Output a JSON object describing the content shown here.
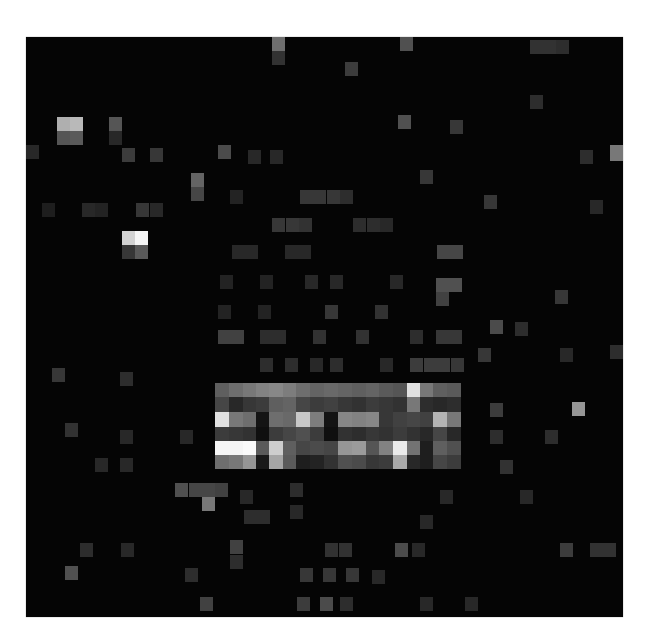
{
  "image": {
    "description": "grayscale pixelated activation / attention map on black background",
    "background": "#050505",
    "origin": [
      26,
      37
    ],
    "size": [
      597,
      580
    ],
    "cell_w": 13.57,
    "cell_h": 14.2
  },
  "cells": [
    [
      215,
      383,
      14,
      14,
      95
    ],
    [
      229,
      383,
      14,
      14,
      110
    ],
    [
      243,
      383,
      14,
      14,
      120
    ],
    [
      256,
      383,
      14,
      14,
      130
    ],
    [
      269,
      383,
      14,
      14,
      135
    ],
    [
      283,
      383,
      14,
      14,
      125
    ],
    [
      296,
      383,
      14,
      14,
      110
    ],
    [
      310,
      383,
      14,
      14,
      100
    ],
    [
      324,
      383,
      14,
      14,
      105
    ],
    [
      338,
      383,
      14,
      14,
      100
    ],
    [
      352,
      383,
      14,
      14,
      95
    ],
    [
      366,
      383,
      14,
      14,
      100
    ],
    [
      379,
      383,
      14,
      14,
      90
    ],
    [
      393,
      383,
      14,
      14,
      85
    ],
    [
      407,
      383,
      14,
      14,
      225
    ],
    [
      420,
      383,
      14,
      14,
      120
    ],
    [
      433,
      383,
      14,
      14,
      95
    ],
    [
      447,
      383,
      14,
      14,
      90
    ],
    [
      215,
      397,
      14,
      15,
      70
    ],
    [
      229,
      397,
      14,
      15,
      40
    ],
    [
      243,
      397,
      14,
      15,
      55
    ],
    [
      256,
      397,
      14,
      15,
      60
    ],
    [
      269,
      397,
      14,
      15,
      95
    ],
    [
      283,
      397,
      14,
      15,
      100
    ],
    [
      296,
      397,
      14,
      15,
      70
    ],
    [
      310,
      397,
      14,
      15,
      60
    ],
    [
      324,
      397,
      14,
      15,
      65
    ],
    [
      338,
      397,
      14,
      15,
      55
    ],
    [
      352,
      397,
      14,
      15,
      50
    ],
    [
      366,
      397,
      14,
      15,
      60
    ],
    [
      379,
      397,
      14,
      15,
      55
    ],
    [
      393,
      397,
      14,
      15,
      50
    ],
    [
      407,
      397,
      14,
      15,
      120
    ],
    [
      420,
      397,
      14,
      15,
      45
    ],
    [
      433,
      397,
      14,
      15,
      40
    ],
    [
      447,
      397,
      14,
      15,
      45
    ],
    [
      215,
      412,
      14,
      15,
      225
    ],
    [
      229,
      412,
      14,
      15,
      120
    ],
    [
      243,
      412,
      14,
      15,
      110
    ],
    [
      256,
      412,
      14,
      15,
      20
    ],
    [
      269,
      412,
      14,
      15,
      110
    ],
    [
      283,
      412,
      14,
      15,
      105
    ],
    [
      296,
      412,
      14,
      15,
      200
    ],
    [
      310,
      412,
      14,
      15,
      125
    ],
    [
      324,
      412,
      14,
      15,
      20
    ],
    [
      338,
      412,
      14,
      15,
      135
    ],
    [
      352,
      412,
      14,
      15,
      130
    ],
    [
      366,
      412,
      14,
      15,
      135
    ],
    [
      379,
      412,
      14,
      15,
      55
    ],
    [
      393,
      412,
      14,
      15,
      65
    ],
    [
      407,
      412,
      14,
      15,
      70
    ],
    [
      420,
      412,
      14,
      15,
      65
    ],
    [
      433,
      412,
      14,
      15,
      180
    ],
    [
      447,
      412,
      14,
      15,
      120
    ],
    [
      215,
      427,
      14,
      14,
      60
    ],
    [
      229,
      427,
      14,
      14,
      55
    ],
    [
      243,
      427,
      14,
      14,
      50
    ],
    [
      256,
      427,
      14,
      14,
      15
    ],
    [
      269,
      427,
      14,
      14,
      60
    ],
    [
      283,
      427,
      14,
      14,
      70
    ],
    [
      296,
      427,
      14,
      14,
      80
    ],
    [
      310,
      427,
      14,
      14,
      60
    ],
    [
      324,
      427,
      14,
      14,
      15
    ],
    [
      338,
      427,
      14,
      14,
      50
    ],
    [
      352,
      427,
      14,
      14,
      45
    ],
    [
      366,
      427,
      14,
      14,
      55
    ],
    [
      379,
      427,
      14,
      14,
      50
    ],
    [
      393,
      427,
      14,
      14,
      60
    ],
    [
      407,
      427,
      14,
      14,
      50
    ],
    [
      420,
      427,
      14,
      14,
      40
    ],
    [
      433,
      427,
      14,
      14,
      70
    ],
    [
      447,
      427,
      14,
      14,
      40
    ],
    [
      215,
      441,
      14,
      14,
      245
    ],
    [
      229,
      441,
      14,
      14,
      245
    ],
    [
      243,
      441,
      14,
      14,
      250
    ],
    [
      256,
      441,
      14,
      14,
      90
    ],
    [
      269,
      441,
      14,
      14,
      205
    ],
    [
      283,
      441,
      14,
      14,
      95
    ],
    [
      296,
      441,
      14,
      14,
      70
    ],
    [
      310,
      441,
      14,
      14,
      75
    ],
    [
      324,
      441,
      14,
      14,
      70
    ],
    [
      338,
      441,
      14,
      14,
      150
    ],
    [
      352,
      441,
      14,
      14,
      155
    ],
    [
      366,
      441,
      14,
      14,
      85
    ],
    [
      379,
      441,
      14,
      14,
      130
    ],
    [
      393,
      441,
      14,
      14,
      235
    ],
    [
      407,
      441,
      14,
      14,
      115
    ],
    [
      420,
      441,
      14,
      14,
      30
    ],
    [
      433,
      441,
      14,
      14,
      95
    ],
    [
      447,
      441,
      14,
      14,
      80
    ],
    [
      215,
      455,
      14,
      14,
      110
    ],
    [
      229,
      455,
      14,
      14,
      120
    ],
    [
      243,
      455,
      14,
      14,
      150
    ],
    [
      256,
      455,
      14,
      14,
      25
    ],
    [
      269,
      455,
      14,
      14,
      165
    ],
    [
      283,
      455,
      14,
      14,
      90
    ],
    [
      296,
      455,
      14,
      14,
      30
    ],
    [
      310,
      455,
      14,
      14,
      35
    ],
    [
      324,
      455,
      14,
      14,
      50
    ],
    [
      338,
      455,
      14,
      14,
      80
    ],
    [
      352,
      455,
      14,
      14,
      75
    ],
    [
      366,
      455,
      14,
      14,
      55
    ],
    [
      379,
      455,
      14,
      14,
      60
    ],
    [
      393,
      455,
      14,
      14,
      170
    ],
    [
      407,
      455,
      14,
      14,
      40
    ],
    [
      420,
      455,
      14,
      14,
      30
    ],
    [
      433,
      455,
      14,
      14,
      70
    ],
    [
      447,
      455,
      14,
      14,
      60
    ],
    [
      57,
      117,
      13,
      14,
      175
    ],
    [
      70,
      117,
      13,
      14,
      185
    ],
    [
      57,
      131,
      13,
      14,
      85
    ],
    [
      70,
      131,
      13,
      14,
      90
    ],
    [
      109,
      117,
      13,
      14,
      85
    ],
    [
      109,
      131,
      13,
      14,
      40
    ],
    [
      122,
      231,
      13,
      14,
      210
    ],
    [
      135,
      231,
      13,
      14,
      245
    ],
    [
      122,
      245,
      13,
      14,
      55
    ],
    [
      135,
      245,
      13,
      14,
      90
    ],
    [
      26,
      145,
      13,
      14,
      40
    ],
    [
      122,
      148,
      13,
      14,
      60
    ],
    [
      150,
      148,
      13,
      14,
      55
    ],
    [
      191,
      173,
      13,
      14,
      100
    ],
    [
      191,
      187,
      13,
      14,
      70
    ],
    [
      42,
      203,
      13,
      14,
      30
    ],
    [
      82,
      203,
      13,
      14,
      40
    ],
    [
      95,
      203,
      13,
      14,
      35
    ],
    [
      136,
      203,
      13,
      14,
      55
    ],
    [
      150,
      203,
      13,
      14,
      40
    ],
    [
      218,
      145,
      13,
      14,
      75
    ],
    [
      248,
      150,
      13,
      14,
      40
    ],
    [
      270,
      150,
      13,
      14,
      40
    ],
    [
      230,
      190,
      13,
      14,
      35
    ],
    [
      300,
      190,
      13,
      14,
      55
    ],
    [
      313,
      190,
      13,
      14,
      55
    ],
    [
      327,
      190,
      13,
      14,
      55
    ],
    [
      340,
      190,
      13,
      14,
      45
    ],
    [
      272,
      218,
      13,
      14,
      55
    ],
    [
      286,
      218,
      13,
      14,
      55
    ],
    [
      299,
      218,
      13,
      14,
      50
    ],
    [
      353,
      218,
      13,
      14,
      45
    ],
    [
      367,
      218,
      13,
      14,
      45
    ],
    [
      380,
      218,
      13,
      14,
      40
    ],
    [
      232,
      245,
      13,
      14,
      40
    ],
    [
      245,
      245,
      13,
      14,
      40
    ],
    [
      285,
      245,
      13,
      14,
      40
    ],
    [
      298,
      245,
      13,
      14,
      40
    ],
    [
      437,
      245,
      13,
      14,
      70
    ],
    [
      450,
      245,
      13,
      14,
      70
    ],
    [
      398,
      115,
      13,
      14,
      80
    ],
    [
      420,
      170,
      13,
      14,
      55
    ],
    [
      345,
      62,
      13,
      14,
      60
    ],
    [
      450,
      120,
      13,
      14,
      55
    ],
    [
      530,
      40,
      13,
      14,
      50
    ],
    [
      543,
      40,
      13,
      14,
      50
    ],
    [
      556,
      40,
      13,
      14,
      45
    ],
    [
      272,
      37,
      13,
      14,
      110
    ],
    [
      272,
      51,
      13,
      14,
      50
    ],
    [
      400,
      37,
      13,
      14,
      80
    ],
    [
      484,
      195,
      13,
      14,
      55
    ],
    [
      530,
      95,
      13,
      14,
      45
    ],
    [
      580,
      150,
      13,
      14,
      45
    ],
    [
      610,
      145,
      13,
      16,
      120
    ],
    [
      590,
      200,
      13,
      14,
      40
    ],
    [
      220,
      275,
      13,
      14,
      35
    ],
    [
      260,
      275,
      13,
      14,
      35
    ],
    [
      305,
      275,
      13,
      14,
      40
    ],
    [
      330,
      275,
      13,
      14,
      40
    ],
    [
      390,
      275,
      13,
      14,
      40
    ],
    [
      436,
      278,
      13,
      14,
      80
    ],
    [
      449,
      278,
      13,
      14,
      80
    ],
    [
      436,
      292,
      13,
      14,
      65
    ],
    [
      218,
      330,
      13,
      14,
      65
    ],
    [
      231,
      330,
      13,
      14,
      65
    ],
    [
      260,
      330,
      13,
      14,
      45
    ],
    [
      273,
      330,
      13,
      14,
      45
    ],
    [
      313,
      330,
      13,
      14,
      50
    ],
    [
      356,
      330,
      13,
      14,
      50
    ],
    [
      410,
      330,
      13,
      14,
      45
    ],
    [
      436,
      330,
      13,
      14,
      55
    ],
    [
      449,
      330,
      13,
      14,
      55
    ],
    [
      218,
      305,
      13,
      14,
      35
    ],
    [
      258,
      305,
      13,
      14,
      35
    ],
    [
      325,
      305,
      13,
      14,
      55
    ],
    [
      375,
      305,
      13,
      14,
      50
    ],
    [
      260,
      358,
      13,
      14,
      45
    ],
    [
      285,
      358,
      13,
      14,
      45
    ],
    [
      310,
      358,
      13,
      14,
      40
    ],
    [
      330,
      358,
      13,
      14,
      45
    ],
    [
      380,
      358,
      13,
      14,
      40
    ],
    [
      410,
      358,
      13,
      14,
      60
    ],
    [
      424,
      358,
      13,
      14,
      60
    ],
    [
      437,
      358,
      13,
      14,
      60
    ],
    [
      451,
      358,
      13,
      14,
      55
    ],
    [
      555,
      290,
      13,
      14,
      55
    ],
    [
      490,
      320,
      13,
      14,
      75
    ],
    [
      515,
      322,
      13,
      14,
      45
    ],
    [
      478,
      348,
      13,
      14,
      55
    ],
    [
      560,
      348,
      13,
      14,
      40
    ],
    [
      610,
      345,
      13,
      14,
      45
    ],
    [
      490,
      403,
      13,
      14,
      60
    ],
    [
      572,
      402,
      13,
      14,
      150
    ],
    [
      490,
      430,
      13,
      14,
      45
    ],
    [
      545,
      430,
      13,
      14,
      45
    ],
    [
      500,
      460,
      13,
      14,
      50
    ],
    [
      52,
      368,
      13,
      14,
      55
    ],
    [
      120,
      372,
      13,
      14,
      45
    ],
    [
      65,
      423,
      13,
      14,
      50
    ],
    [
      120,
      430,
      13,
      14,
      40
    ],
    [
      180,
      430,
      13,
      14,
      40
    ],
    [
      95,
      458,
      13,
      14,
      40
    ],
    [
      120,
      458,
      13,
      14,
      40
    ],
    [
      175,
      483,
      13,
      14,
      80
    ],
    [
      189,
      483,
      13,
      14,
      70
    ],
    [
      202,
      483,
      13,
      14,
      70
    ],
    [
      215,
      483,
      13,
      14,
      65
    ],
    [
      202,
      497,
      13,
      14,
      120
    ],
    [
      240,
      490,
      13,
      14,
      40
    ],
    [
      290,
      483,
      13,
      14,
      45
    ],
    [
      290,
      505,
      13,
      14,
      40
    ],
    [
      244,
      510,
      13,
      14,
      45
    ],
    [
      257,
      510,
      13,
      14,
      45
    ],
    [
      420,
      515,
      13,
      14,
      40
    ],
    [
      440,
      490,
      13,
      14,
      40
    ],
    [
      520,
      490,
      13,
      14,
      40
    ],
    [
      80,
      543,
      13,
      14,
      45
    ],
    [
      121,
      543,
      13,
      14,
      40
    ],
    [
      230,
      540,
      13,
      14,
      65
    ],
    [
      230,
      555,
      13,
      14,
      45
    ],
    [
      325,
      543,
      13,
      14,
      50
    ],
    [
      339,
      543,
      13,
      14,
      50
    ],
    [
      395,
      543,
      13,
      14,
      75
    ],
    [
      412,
      543,
      13,
      14,
      40
    ],
    [
      560,
      543,
      13,
      14,
      60
    ],
    [
      590,
      543,
      13,
      14,
      50
    ],
    [
      603,
      543,
      13,
      14,
      50
    ],
    [
      65,
      566,
      13,
      14,
      80
    ],
    [
      185,
      568,
      13,
      14,
      45
    ],
    [
      300,
      568,
      13,
      14,
      55
    ],
    [
      323,
      568,
      13,
      14,
      55
    ],
    [
      346,
      568,
      13,
      14,
      55
    ],
    [
      372,
      570,
      13,
      14,
      40
    ],
    [
      200,
      597,
      13,
      14,
      65
    ],
    [
      297,
      597,
      13,
      14,
      60
    ],
    [
      320,
      597,
      13,
      14,
      75
    ],
    [
      340,
      597,
      13,
      14,
      45
    ],
    [
      420,
      597,
      13,
      14,
      40
    ],
    [
      465,
      597,
      13,
      14,
      40
    ]
  ]
}
